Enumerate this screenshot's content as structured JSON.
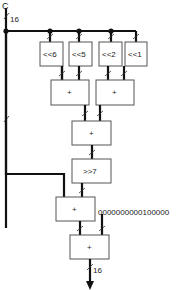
{
  "diagram": {
    "input": {
      "label": "C",
      "width": "16"
    },
    "shifters": [
      {
        "label": "<<6"
      },
      {
        "label": "<<5"
      },
      {
        "label": "<<2"
      },
      {
        "label": "<<1"
      }
    ],
    "adders": [
      {
        "label": "+"
      },
      {
        "label": "+"
      },
      {
        "label": "+"
      },
      {
        "label": "+"
      },
      {
        "label": "+"
      }
    ],
    "right_shift": {
      "label": ">>7"
    },
    "constant": {
      "label": "0000000000100000"
    },
    "output": {
      "width": "16"
    }
  }
}
